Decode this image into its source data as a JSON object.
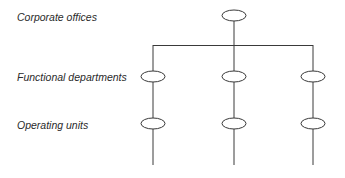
{
  "diagram": {
    "type": "organizational-hierarchy",
    "levels": [
      {
        "label": "Corporate offices",
        "node_count": 1
      },
      {
        "label": "Functional departments",
        "node_count": 3
      },
      {
        "label": "Operating units",
        "node_count": 3
      }
    ],
    "colors": {
      "line": "#3a3a3a",
      "text": "#2a2a2a",
      "background": "#ffffff"
    }
  }
}
